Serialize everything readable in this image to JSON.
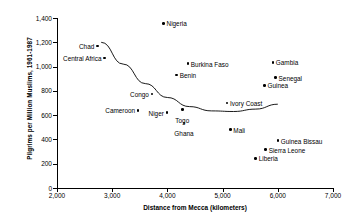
{
  "chart_data": {
    "type": "scatter",
    "title": "",
    "xlabel": "Distance from Mecca (kilometers)",
    "ylabel": "Pilgrims per Million Muslims, 1961-1987",
    "xlim": [
      2000,
      7000
    ],
    "ylim": [
      0,
      1400
    ],
    "xticks": [
      "2,000",
      "3,000",
      "4,000",
      "5,000",
      "6,000",
      "7,000"
    ],
    "xtick_values": [
      2000,
      3000,
      4000,
      5000,
      6000,
      7000
    ],
    "yticks": [
      "0",
      "200",
      "400",
      "600",
      "800",
      "1,000",
      "1,200",
      "1,400"
    ],
    "ytick_values": [
      0,
      200,
      400,
      600,
      800,
      1000,
      1200,
      1400
    ],
    "grid": false,
    "legend": "none",
    "points": [
      {
        "name": "Nigeria",
        "x": 3930,
        "y": 1355,
        "label_side": "r"
      },
      {
        "name": "Chad",
        "x": 2730,
        "y": 1170,
        "label_side": "l"
      },
      {
        "name": "Central Africa",
        "x": 2860,
        "y": 1070,
        "label_side": "l"
      },
      {
        "name": "Gambia",
        "x": 5910,
        "y": 1035,
        "label_side": "r"
      },
      {
        "name": "Burkina Faso",
        "x": 4370,
        "y": 1025,
        "label_side": "r"
      },
      {
        "name": "Benin",
        "x": 4170,
        "y": 930,
        "label_side": "r"
      },
      {
        "name": "Senegal",
        "x": 5960,
        "y": 910,
        "label_side": "r"
      },
      {
        "name": "Guinea",
        "x": 5760,
        "y": 845,
        "label_side": "r"
      },
      {
        "name": "Congo",
        "x": 3720,
        "y": 775,
        "label_side": "l"
      },
      {
        "name": "Cameroon",
        "x": 3470,
        "y": 640,
        "label_side": "l"
      },
      {
        "name": "Ivory Coast",
        "x": 5080,
        "y": 700,
        "label_side": "r"
      },
      {
        "name": "Togo",
        "x": 4270,
        "y": 645,
        "label_side": "t"
      },
      {
        "name": "Niger",
        "x": 3990,
        "y": 620,
        "label_side": "l"
      },
      {
        "name": "Ghana",
        "x": 4300,
        "y": 535,
        "label_side": "t"
      },
      {
        "name": "Mali",
        "x": 5140,
        "y": 480,
        "label_side": "r"
      },
      {
        "name": "Guinea Bissau",
        "x": 6000,
        "y": 390,
        "label_side": "r"
      },
      {
        "name": "Sierra Leone",
        "x": 5780,
        "y": 315,
        "label_side": "r"
      },
      {
        "name": "Liberia",
        "x": 5600,
        "y": 245,
        "label_side": "r"
      }
    ],
    "trendline": {
      "label": "fitted curve",
      "points": [
        {
          "x": 2800,
          "y": 1200
        },
        {
          "x": 3200,
          "y": 1020
        },
        {
          "x": 3600,
          "y": 860
        },
        {
          "x": 4000,
          "y": 745
        },
        {
          "x": 4400,
          "y": 670
        },
        {
          "x": 4800,
          "y": 635
        },
        {
          "x": 5200,
          "y": 630
        },
        {
          "x": 5600,
          "y": 650
        },
        {
          "x": 6000,
          "y": 690
        }
      ]
    }
  },
  "colors": {
    "axis": "#000000",
    "marker": "#000000",
    "trend": "#000000",
    "background": "#ffffff"
  }
}
